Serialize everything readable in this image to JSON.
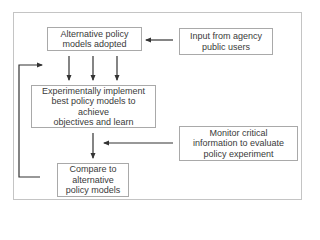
{
  "diagram": {
    "type": "flowchart",
    "nodes": [
      {
        "id": "adopted",
        "label": "Alternative policy\nmodels adopted"
      },
      {
        "id": "input",
        "label": "Input from agency\npublic users"
      },
      {
        "id": "implement",
        "label": "Experimentally implement\nbest policy models to achieve\nobjectives and learn"
      },
      {
        "id": "monitor",
        "label": "Monitor critical\ninformation to evaluate\npolicy experiment"
      },
      {
        "id": "compare",
        "label": "Compare to\nalternative\npolicy models"
      }
    ],
    "edges": [
      {
        "from": "input",
        "to": "adopted"
      },
      {
        "from": "adopted",
        "to": "implement",
        "count": 3
      },
      {
        "from": "implement",
        "to": "compare"
      },
      {
        "from": "monitor",
        "to": "implement-compare-link"
      },
      {
        "from": "compare",
        "to": "adopted-implement-link",
        "style": "feedback-loop"
      }
    ],
    "colors": {
      "frame": "#c4c4c4",
      "box_border": "#a9a9a9",
      "arrow": "#333333",
      "text": "#3a3a3a"
    }
  }
}
